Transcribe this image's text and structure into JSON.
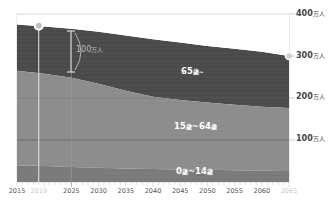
{
  "chart_data": {
    "type": "area",
    "stacked": true,
    "title": "",
    "xlabel": "",
    "ylabel": "万人",
    "x": [
      2015,
      2020,
      2025,
      2030,
      2035,
      2040,
      2045,
      2050,
      2055,
      2060,
      2065
    ],
    "x_tick_labels": [
      "2015",
      "2019",
      "2025",
      "2030",
      "2035",
      "2040",
      "2045",
      "2050",
      "2055",
      "2060",
      "2065"
    ],
    "faded_x_tick_labels": [
      "2019",
      "2065"
    ],
    "y_tick_labels": [
      "100万人",
      "200万人",
      "300万人",
      "400万人"
    ],
    "ylim": [
      0,
      400
    ],
    "grid": false,
    "series": [
      {
        "name": "0歳~14歳",
        "values": [
          40,
          38,
          36,
          34,
          32,
          31,
          30,
          29,
          28,
          27,
          26
        ]
      },
      {
        "name": "15歳~64歳",
        "values": [
          225,
          220,
          212,
          200,
          185,
          172,
          165,
          160,
          156,
          152,
          150
        ]
      },
      {
        "name": "65歳~",
        "values": [
          110,
          112,
          117,
          124,
          132,
          137,
          137,
          135,
          133,
          131,
          124
        ]
      }
    ],
    "totals": [
      375,
      370,
      365,
      358,
      349,
      340,
      332,
      324,
      317,
      310,
      300
    ],
    "annotations": [
      {
        "text": "100万人",
        "type": "bracket",
        "x": 2025,
        "from": 265,
        "to": 365
      },
      {
        "type": "marker",
        "x": 2019,
        "y": 372
      },
      {
        "type": "marker",
        "x": 2065,
        "y": 300
      }
    ],
    "colors": {
      "age_65_plus": "#4a4a4a",
      "age_15_64": "#8c8c8c",
      "age_0_14": "#7a7a7a",
      "axis": "#cfcfcf"
    }
  },
  "labels": {
    "band_65": {
      "num": "65",
      "unit": "歳~"
    },
    "band_15_64": {
      "num": "15",
      "unit1": "歳",
      "sep": "~64",
      "unit2": "歳"
    },
    "band_0_14": {
      "num": "0",
      "unit1": "歳",
      "sep": "~14",
      "unit2": "歳"
    },
    "bracket": {
      "num": "100",
      "unit": "万人"
    },
    "y400": {
      "num": "400",
      "unit": "万人"
    },
    "y300": {
      "num": "300",
      "unit": "万人"
    },
    "y200": {
      "num": "200",
      "unit": "万人"
    },
    "y100": {
      "num": "100",
      "unit": "万人"
    }
  }
}
